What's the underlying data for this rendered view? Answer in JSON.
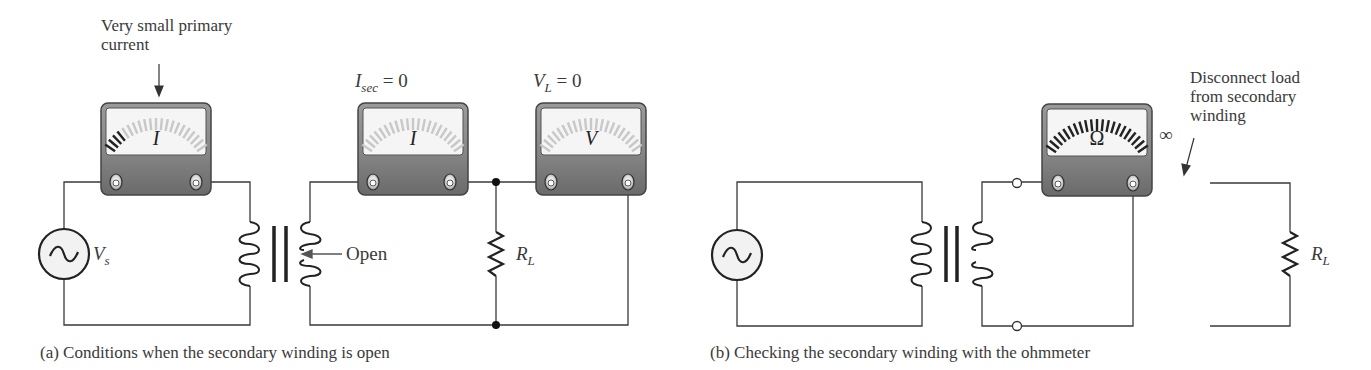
{
  "panel_a": {
    "caption": "(a) Conditions when the secondary winding is open",
    "annotation_primary": [
      "Very small primary",
      "current"
    ],
    "meter_primary": {
      "label": "I",
      "type": "ammeter"
    },
    "meter_secondary": {
      "label": "I",
      "type": "ammeter",
      "reading_label": "I",
      "reading_sub": "sec",
      "reading_value": " = 0"
    },
    "meter_load": {
      "label": "V",
      "type": "voltmeter",
      "reading_label": "V",
      "reading_sub": "L",
      "reading_value": " = 0"
    },
    "source": {
      "label": "V",
      "sub": "s"
    },
    "open_label": "Open",
    "load": {
      "label": "R",
      "sub": "L"
    }
  },
  "panel_b": {
    "caption": "(b) Checking the secondary winding with the ohmmeter",
    "meter_ohm": {
      "label": "Ω",
      "type": "ohmmeter",
      "reading": "∞"
    },
    "annotation_disconnect": [
      "Disconnect load",
      "from secondary",
      "winding"
    ],
    "load": {
      "label": "R",
      "sub": "L"
    }
  },
  "colors": {
    "wire": "#3a3a3a",
    "meter_body": "#777777",
    "meter_face": "#f4f4f4",
    "tick_active": "#222222",
    "tick_faint": "#c8c8c8"
  }
}
